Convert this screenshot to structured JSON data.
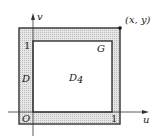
{
  "diagram": {
    "axis_x_label": "u",
    "axis_y_label": "v",
    "origin_label": "O",
    "tick_x_label": "1",
    "tick_y_label": "1",
    "region_outer_label": "D",
    "region_inner_label": "D",
    "region_inner_subscript": "4",
    "boundary_label": "G",
    "point_label": "(x, y)",
    "colors": {
      "stroke": "#333333",
      "band_fill": "#d9d9d9",
      "inner_fill": "#ffffff"
    }
  }
}
